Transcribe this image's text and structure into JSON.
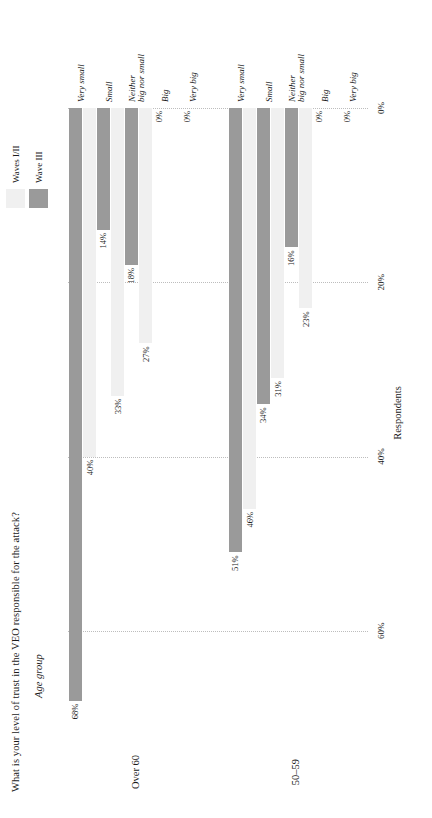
{
  "chart_data": {
    "type": "bar",
    "title": "What is your level of trust in the VEO responsible for the attack?",
    "subtitle": "Age group",
    "xlabel": "Respondents",
    "ylabel": "",
    "orientation": "horizontal",
    "grid": true,
    "legend_position": "top-right",
    "axis": {
      "ticks": [
        "0%",
        "20%",
        "40%",
        "60%"
      ],
      "tick_values": [
        0,
        20,
        40,
        60
      ],
      "lim": [
        0,
        70
      ]
    },
    "categories": [
      "Very small",
      "Small",
      "Neither big nor small",
      "Big",
      "Very big"
    ],
    "category_lines": [
      [
        "Very small"
      ],
      [
        "Small"
      ],
      [
        "Neither",
        "big nor small"
      ],
      [
        "Big"
      ],
      [
        "Very big"
      ]
    ],
    "series": [
      {
        "name": "Waves I/II",
        "color": "#f0f0f0"
      },
      {
        "name": "Wave III",
        "color": "#9a9a9a"
      }
    ],
    "panels": [
      {
        "name": "Over 60",
        "bars": [
          {
            "category": "Very small",
            "waves_i_ii": 40,
            "wave_iii": 68,
            "waves_i_ii_label": "40%",
            "wave_iii_label": "68%"
          },
          {
            "category": "Small",
            "waves_i_ii": 33,
            "wave_iii": 14,
            "waves_i_ii_label": "33%",
            "wave_iii_label": "14%"
          },
          {
            "category": "Neither big nor small",
            "waves_i_ii": 27,
            "wave_iii": 18,
            "waves_i_ii_label": "27%",
            "wave_iii_label": "18%"
          },
          {
            "category": "Big",
            "waves_i_ii": 0,
            "wave_iii": 0,
            "waves_i_ii_label": "",
            "wave_iii_label": "0%"
          },
          {
            "category": "Very big",
            "waves_i_ii": 0,
            "wave_iii": 0,
            "waves_i_ii_label": "",
            "wave_iii_label": "0%"
          }
        ]
      },
      {
        "name": "50–59",
        "bars": [
          {
            "category": "Very small",
            "waves_i_ii": 46,
            "wave_iii": 51,
            "waves_i_ii_label": "46%",
            "wave_iii_label": "51%"
          },
          {
            "category": "Small",
            "waves_i_ii": 31,
            "wave_iii": 34,
            "waves_i_ii_label": "31%",
            "wave_iii_label": "34%"
          },
          {
            "category": "Neither big nor small",
            "waves_i_ii": 23,
            "wave_iii": 16,
            "waves_i_ii_label": "23%",
            "wave_iii_label": "16%"
          },
          {
            "category": "Big",
            "waves_i_ii": 0,
            "wave_iii": 0,
            "waves_i_ii_label": "",
            "wave_iii_label": "0%"
          },
          {
            "category": "Very big",
            "waves_i_ii": 0,
            "wave_iii": 0,
            "waves_i_ii_label": "",
            "wave_iii_label": "0%"
          }
        ]
      }
    ],
    "colors": {
      "bar_light": "#f0f0f0",
      "bar_dark": "#9a9a9a",
      "gridline": "#bdbdbd",
      "text": "#1a1a1a",
      "background": "#ffffff"
    }
  }
}
